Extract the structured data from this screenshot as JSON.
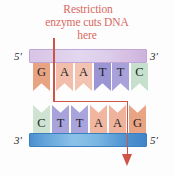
{
  "caption": {
    "line1": "Restriction",
    "line2": "enzyme cuts DNA",
    "line3": "here",
    "color": "#d9685f"
  },
  "top_strand": {
    "left_end_label": "5'",
    "right_end_label": "3'",
    "backbone_color": "#ddcdea",
    "bases": [
      {
        "letter": "G",
        "color": "#e8a383"
      },
      {
        "letter": "A",
        "color": "#f2beab"
      },
      {
        "letter": "A",
        "color": "#f3c3b1"
      },
      {
        "letter": "T",
        "color": "#9c95d4"
      },
      {
        "letter": "T",
        "color": "#a9a2da"
      },
      {
        "letter": "C",
        "color": "#c7e0cd"
      }
    ]
  },
  "bottom_strand": {
    "left_end_label": "3'",
    "right_end_label": "5'",
    "backbone_color": "#6fb0e0",
    "bases": [
      {
        "letter": "C",
        "color": "#cfe3d2"
      },
      {
        "letter": "T",
        "color": "#a8a3da"
      },
      {
        "letter": "T",
        "color": "#a9a4db"
      },
      {
        "letter": "A",
        "color": "#f0b69f"
      },
      {
        "letter": "A",
        "color": "#eeb39a"
      },
      {
        "letter": "G",
        "color": "#e9a484"
      }
    ]
  },
  "cut_path": {
    "color": "#cf5448",
    "description": "staggered cut"
  }
}
